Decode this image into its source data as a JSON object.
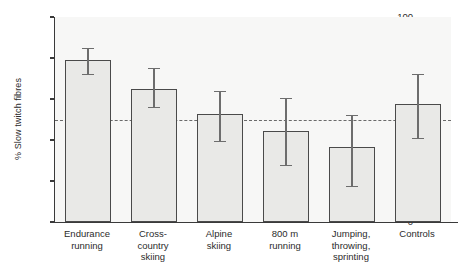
{
  "chart_data": {
    "type": "bar",
    "title": "",
    "subtitle": "",
    "xlabel": "",
    "ylabel": "% Slow twitch fibres",
    "ylim": [
      0,
      100
    ],
    "yticks": [
      0,
      20,
      40,
      60,
      80,
      100
    ],
    "grid": false,
    "legend": null,
    "categories": [
      "Endurance\nrunning",
      "Cross-\ncountry\nskiing",
      "Alpine\nskiing",
      "800 m\nrunning",
      "Jumping,\nthrowing,\nsprinting",
      "Controls"
    ],
    "values": [
      79,
      65,
      52.5,
      44.5,
      36.5,
      57.5
    ],
    "error_low": [
      72,
      56,
      39.5,
      28,
      17.5,
      41
    ],
    "error_high": [
      85,
      75,
      64,
      60.5,
      52,
      72
    ],
    "annotations": [
      {
        "name": "reference-line",
        "type": "horizontal-dashed-line",
        "value": 50,
        "label": ""
      }
    ],
    "colors": {
      "bar_fill": "#e9e9e7",
      "bar_edge": "#4a4a4a",
      "error_bar": "#6d6d6d",
      "reference_line": "#6a6a6a",
      "axis": "#3a3a3a",
      "plot_background": "#f7f7f6",
      "figure_background": "#ffffff",
      "text": "#2b2b2b"
    }
  }
}
